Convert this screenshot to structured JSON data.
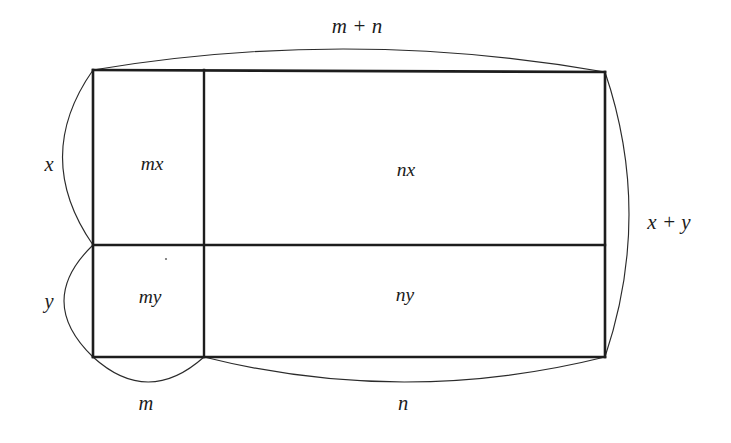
{
  "figure": {
    "title_concept": "area-model-distributive-property",
    "background_color": "#ffffff",
    "line_color": "#1d1d1d",
    "arc_color": "#2b2b2b"
  },
  "labels": {
    "top_brace": "m + n",
    "right_brace": "x + y",
    "left_upper_brace": "x",
    "left_lower_brace": "y",
    "bottom_left_brace": "m",
    "bottom_right_brace": "n"
  },
  "cells": [
    {
      "id": "top-left",
      "label": "mx"
    },
    {
      "id": "top-right",
      "label": "nx"
    },
    {
      "id": "bottom-left",
      "label": "my"
    },
    {
      "id": "bottom-right",
      "label": "ny"
    }
  ],
  "geometry": {
    "rect": {
      "left": 93,
      "right": 605,
      "top": 70,
      "bottom": 357
    },
    "vertical_divider_x": 204,
    "horizontal_divider_y": 245
  }
}
